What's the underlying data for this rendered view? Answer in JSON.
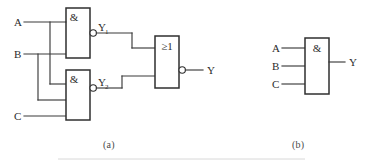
{
  "figure": {
    "line_color": "#3a3a3a",
    "text_color": "#2b2b2b",
    "background": "#ffffff"
  },
  "captions": {
    "part_a": "(a)",
    "part_b": "(b)"
  },
  "part_a": {
    "name": "NAND-NAND to NOR network",
    "inputs": [
      {
        "label": "A",
        "x": 14,
        "y": 22
      },
      {
        "label": "B",
        "x": 14,
        "y": 54
      },
      {
        "label": "C",
        "x": 14,
        "y": 116
      }
    ],
    "gates": [
      {
        "id": "nand1",
        "symbol": "&",
        "type": "nand",
        "inverted_output": true,
        "output_label": "Y1",
        "output_label_text": "Y",
        "output_label_sub": "1"
      },
      {
        "id": "nand2",
        "symbol": "&",
        "type": "nand",
        "inverted_output": true,
        "output_label": "Y2",
        "output_label_text": "Y",
        "output_label_sub": "2"
      },
      {
        "id": "nor1",
        "symbol": "≥1",
        "type": "nor",
        "inverted_output": true,
        "output_label": "Y",
        "output_label_text": "Y",
        "output_label_sub": ""
      }
    ],
    "output": {
      "label": "Y",
      "x": 207,
      "y": 70
    }
  },
  "part_b": {
    "name": "Three input AND gate",
    "inputs": [
      {
        "label": "A",
        "x": 272,
        "y": 48
      },
      {
        "label": "B",
        "x": 272,
        "y": 66
      },
      {
        "label": "C",
        "x": 272,
        "y": 84
      }
    ],
    "gates": [
      {
        "id": "and1",
        "symbol": "&",
        "type": "and",
        "inverted_output": false,
        "output_label": "Y"
      }
    ],
    "output": {
      "label": "Y",
      "x": 349,
      "y": 62
    }
  }
}
